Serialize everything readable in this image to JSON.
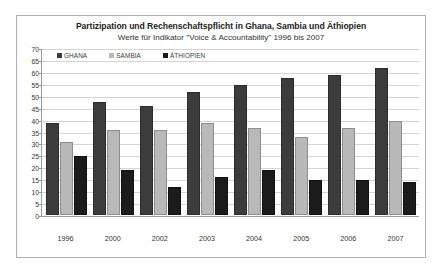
{
  "chart_data": {
    "type": "bar",
    "title": "Partizipation und Rechenschaftspflicht in Ghana, Sambia und Äthiopien",
    "subtitle": "Werte für Indikator \"Voice & Accountability\" 1996 bis 2007",
    "xlabel": "",
    "ylabel": "",
    "ylim": [
      0,
      70
    ],
    "ytick_step": 5,
    "yticks": [
      70,
      65,
      60,
      55,
      50,
      45,
      40,
      35,
      30,
      25,
      20,
      15,
      10,
      5,
      0
    ],
    "grid": true,
    "legend_position": "top-left",
    "categories": [
      "1996",
      "2000",
      "2002",
      "2003",
      "2004",
      "2005",
      "2006",
      "2007"
    ],
    "series": [
      {
        "name": "GHANA",
        "color": "#3c3c3c",
        "values": [
          38,
          47,
          45,
          51,
          54,
          57,
          58,
          61
        ]
      },
      {
        "name": "SAMBIA",
        "color": "#b9b9b9",
        "values": [
          30,
          35,
          35,
          38,
          36,
          32,
          36,
          39
        ]
      },
      {
        "name": "ÄTHIOPIEN",
        "color": "#1b1b1b",
        "values": [
          24,
          18,
          11,
          15,
          18,
          14,
          14,
          13
        ]
      }
    ]
  }
}
